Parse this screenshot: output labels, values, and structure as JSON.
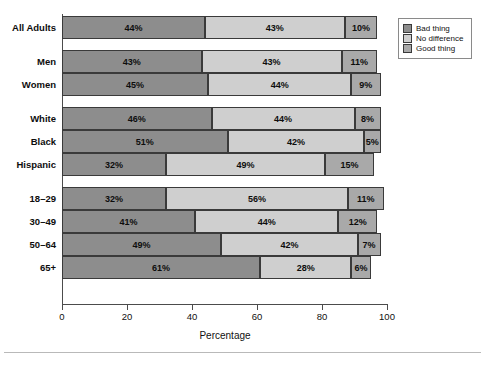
{
  "chart_data": {
    "type": "bar",
    "orientation": "horizontal",
    "stacked": true,
    "title": "",
    "xlabel": "Percentage",
    "ylabel": "",
    "xlim": [
      0,
      100
    ],
    "xticks": [
      0,
      20,
      40,
      60,
      80,
      100
    ],
    "grid": false,
    "legend_position": "top-right",
    "categories": [
      "All Adults",
      "Men",
      "Women",
      "White",
      "Black",
      "Hispanic",
      "18–29",
      "30–49",
      "50–64",
      "65+"
    ],
    "group_breaks_after": [
      "All Adults",
      "Women",
      "Hispanic"
    ],
    "series": [
      {
        "name": "Bad thing",
        "color": "#8d8d8d",
        "values": [
          44,
          43,
          45,
          46,
          51,
          32,
          32,
          41,
          49,
          61
        ],
        "labels": [
          "44%",
          "43%",
          "45%",
          "46%",
          "51%",
          "32%",
          "32%",
          "41%",
          "49%",
          "61%"
        ]
      },
      {
        "name": "No difference",
        "color": "#cfcfcf",
        "values": [
          43,
          43,
          44,
          44,
          42,
          49,
          56,
          44,
          42,
          28
        ],
        "labels": [
          "43%",
          "43%",
          "44%",
          "44%",
          "42%",
          "49%",
          "56%",
          "44%",
          "42%",
          "28%"
        ]
      },
      {
        "name": "Good thing",
        "color": "#a9a9a9",
        "values": [
          10,
          11,
          9,
          8,
          5,
          15,
          11,
          12,
          7,
          6
        ],
        "labels": [
          "10%",
          "11%",
          "9%",
          "8%",
          "5%",
          "15%",
          "11%",
          "12%",
          "7%",
          "6%"
        ]
      }
    ]
  },
  "legend": {
    "items": [
      {
        "label": "Bad thing",
        "color": "#8d8d8d"
      },
      {
        "label": "No difference",
        "color": "#cfcfcf"
      },
      {
        "label": "Good thing",
        "color": "#a9a9a9"
      }
    ]
  },
  "axis": {
    "x_title": "Percentage",
    "x_tick_labels": [
      "0",
      "20",
      "40",
      "60",
      "80",
      "100"
    ]
  }
}
